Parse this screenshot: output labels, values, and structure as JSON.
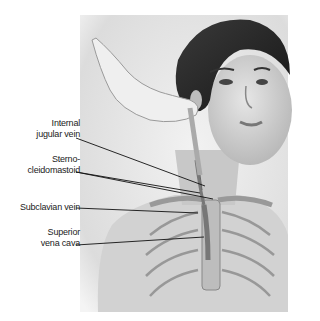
{
  "figure": {
    "labels": [
      {
        "id": "internal-jugular-vein",
        "line1": "Internal",
        "line2": "jugular vein"
      },
      {
        "id": "sternocleidomastoid",
        "line1": "Sterno-",
        "line2": "cleidomastoid"
      },
      {
        "id": "subclavian-vein",
        "line1": "",
        "line2": "Subclavian vein"
      },
      {
        "id": "superior-vena-cava",
        "line1": "Superior",
        "line2": "vena cava"
      }
    ]
  }
}
